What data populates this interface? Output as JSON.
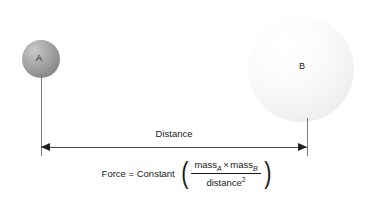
{
  "diagram": {
    "background_color": "#ffffff"
  },
  "bodies": [
    {
      "id": "A",
      "label": "A",
      "name": "sphere-a",
      "color": "#9d9d9d",
      "diameter_px": 38,
      "center": {
        "x": 41,
        "y": 59
      }
    },
    {
      "id": "B",
      "label": "B",
      "name": "sphere-b",
      "color": "#f5f5f5",
      "diameter_px": 106,
      "center": {
        "x": 301,
        "y": 69
      }
    }
  ],
  "dimension": {
    "label": "Distance",
    "arrow_color": "#1f1f1f",
    "line_color": "#4a4a4a",
    "from_x": 41,
    "to_x": 307,
    "y": 147
  },
  "leader_lines": {
    "color": "#7a7a7a"
  },
  "formula": {
    "lhs": "Force = Constant",
    "paren_open": "(",
    "paren_close": ")",
    "numerator": {
      "term_a": "mass",
      "sub_a": "A",
      "operator": "×",
      "term_b": "mass",
      "sub_b": "B"
    },
    "denominator": {
      "term": "distance",
      "exponent": "2"
    },
    "plain_text": "Force = Constant ( massA × massB / distance² )"
  }
}
